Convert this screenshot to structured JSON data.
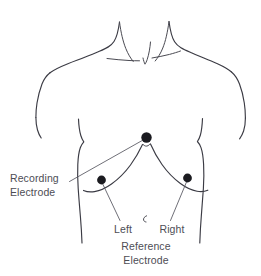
{
  "figure": {
    "background_color": "#ffffff",
    "line_color": "#3b3b44",
    "text_color": "#4d4d55",
    "electrode_color": "#1b1b20"
  },
  "labels": {
    "recording_line1": "Recording",
    "recording_line2": "Electrode",
    "left": "Left",
    "right": "Right",
    "reference_line1": "Reference",
    "reference_line2": "Electrode"
  },
  "electrodes": [
    {
      "name": "recording-electrode",
      "label": "Recording Electrode",
      "cx": 146.5,
      "cy": 137.5,
      "r": 5.2
    },
    {
      "name": "left-reference-electrode",
      "label": "Left",
      "cx": 101.5,
      "cy": 180.0,
      "r": 4.4
    },
    {
      "name": "right-reference-electrode",
      "label": "Right",
      "cx": 187.5,
      "cy": 178.0,
      "r": 4.4
    }
  ]
}
